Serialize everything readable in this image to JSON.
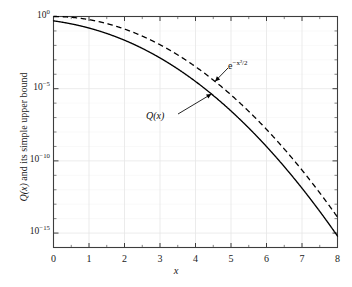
{
  "figure": {
    "background_color": "#ffffff",
    "frame_color": "#3d3d3d",
    "curve_color": "#000000",
    "grid_color": "#e6e6e6"
  },
  "axes": {
    "x_title": "x",
    "y_title_math": "Q(x)",
    "y_title_rest": " and its simple upper bound",
    "y_tick_labels": [
      "10⁰",
      "10⁻⁵",
      "10⁻¹⁰",
      "10⁻¹⁵"
    ],
    "y_tick_mantissa": "10",
    "y_tick_exponents": [
      "0",
      "-5",
      "-10",
      "-15"
    ],
    "x_tick_labels": [
      "0",
      "1",
      "2",
      "3",
      "4",
      "5",
      "6",
      "7",
      "8"
    ]
  },
  "annotations": {
    "upper_bound_base": "e",
    "upper_bound_exponent": "−x²/2",
    "upper_bound_full": "e⁻ˣ²ᐟ²",
    "q_function_label": "Q(x)"
  },
  "chart_data": {
    "type": "line",
    "title": "",
    "xlabel": "x",
    "ylabel": "Q(x) and its simple upper bound",
    "xlim": [
      0,
      8
    ],
    "ylim": [
      1e-16,
      1
    ],
    "yscale": "log",
    "xscale": "linear",
    "grid": true,
    "legend": "none",
    "x_ticks": [
      0,
      1,
      2,
      3,
      4,
      5,
      6,
      7,
      8
    ],
    "y_ticks": [
      1,
      1e-05,
      1e-10,
      1e-15
    ],
    "x": [
      0,
      0.25,
      0.5,
      0.75,
      1,
      1.25,
      1.5,
      1.75,
      2,
      2.25,
      2.5,
      2.75,
      3,
      3.25,
      3.5,
      3.75,
      4,
      4.25,
      4.5,
      4.75,
      5,
      5.25,
      5.5,
      5.75,
      6,
      6.25,
      6.5,
      6.75,
      7,
      7.25,
      7.5,
      7.75,
      8
    ],
    "series": [
      {
        "name": "Q(x)",
        "style": "solid",
        "values": [
          0.5,
          0.4013,
          0.3085,
          0.2266,
          0.1587,
          0.1056,
          0.06681,
          0.04006,
          0.02275,
          0.01222,
          0.00621,
          0.00298,
          0.00135,
          0.000577,
          0.0002326,
          8.842e-05,
          3.167e-05,
          1.069e-05,
          3.398e-06,
          1.017e-06,
          2.867e-07,
          7.605e-08,
          1.899e-08,
          4.462e-09,
          9.866e-10,
          2.052e-10,
          4.016e-11,
          7.392e-12,
          1.28e-12,
          2.087e-13,
          3.191e-14,
          4.592e-15,
          6.221e-16
        ]
      },
      {
        "name": "e^{-x^2/2}",
        "style": "dashed",
        "values": [
          1.0,
          0.9692,
          0.8825,
          0.7548,
          0.6065,
          0.4578,
          0.3247,
          0.2163,
          0.1353,
          0.07956,
          0.04394,
          0.0228,
          0.01111,
          0.005086,
          0.002187,
          0.0008838,
          0.0003355,
          0.0001196,
          4.006e-05,
          1.26e-05,
          3.727e-06,
          1.036e-06,
          2.7e-07,
          6.61e-08,
          1.523e-08,
          3.292e-09,
          6.679e-10,
          1.273e-10,
          2.29e-11,
          3.857e-12,
          6.101e-13,
          9.063e-14,
          1.266e-14
        ]
      }
    ],
    "annotations": [
      {
        "text": "e^{-x^2/2}",
        "points_to_series": "e^{-x^2/2}",
        "at_x": 4.55
      },
      {
        "text": "Q(x)",
        "points_to_series": "Q(x)",
        "at_x": 4.45
      }
    ]
  }
}
